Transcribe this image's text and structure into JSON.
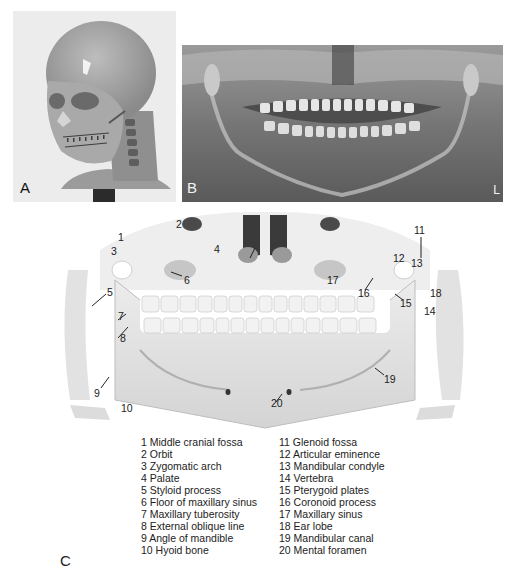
{
  "figure": {
    "panels": [
      {
        "id": "A",
        "letter": "A",
        "description": "Patient head model with transparent skin showing skull and cervical spine"
      },
      {
        "id": "B",
        "letter": "B",
        "description": "Panoramic dental radiograph",
        "side_marker": "L"
      },
      {
        "id": "C",
        "letter": "C",
        "description": "Labeled illustration of panoramic anatomy"
      }
    ]
  },
  "illustration": {
    "labels": [
      {
        "n": "1",
        "x": 118,
        "y": 232
      },
      {
        "n": "2",
        "x": 178,
        "y": 221
      },
      {
        "n": "3",
        "x": 112,
        "y": 247
      },
      {
        "n": "4",
        "x": 214,
        "y": 246
      },
      {
        "n": "5",
        "x": 107,
        "y": 290
      },
      {
        "n": "6",
        "x": 184,
        "y": 278
      },
      {
        "n": "7",
        "x": 119,
        "y": 316
      },
      {
        "n": "8",
        "x": 120,
        "y": 338
      },
      {
        "n": "9",
        "x": 94,
        "y": 389
      },
      {
        "n": "10",
        "x": 121,
        "y": 404
      },
      {
        "n": "11",
        "x": 416,
        "y": 226
      },
      {
        "n": "12",
        "x": 393,
        "y": 255
      },
      {
        "n": "13",
        "x": 411,
        "y": 260
      },
      {
        "n": "14",
        "x": 423,
        "y": 308
      },
      {
        "n": "15",
        "x": 400,
        "y": 300
      },
      {
        "n": "16",
        "x": 358,
        "y": 290
      },
      {
        "n": "17",
        "x": 328,
        "y": 277
      },
      {
        "n": "18",
        "x": 430,
        "y": 290
      },
      {
        "n": "19",
        "x": 384,
        "y": 376
      },
      {
        "n": "20",
        "x": 271,
        "y": 399
      }
    ]
  },
  "legend": {
    "left": [
      "1 Middle cranial fossa",
      "2 Orbit",
      "3 Zygomatic arch",
      "4 Palate",
      "5 Styloid process",
      "6 Floor of maxillary sinus",
      "7 Maxillary tuberosity",
      "8 External oblique line",
      "9 Angle of mandible",
      "10 Hyoid bone"
    ],
    "right": [
      "11 Glenoid fossa",
      "12 Articular eminence",
      "13 Mandibular condyle",
      "14 Vertebra",
      "15 Pterygoid plates",
      "16 Coronoid process",
      "17 Maxillary sinus",
      "18 Ear lobe",
      "19 Mandibular canal",
      "20 Mental foramen"
    ]
  }
}
